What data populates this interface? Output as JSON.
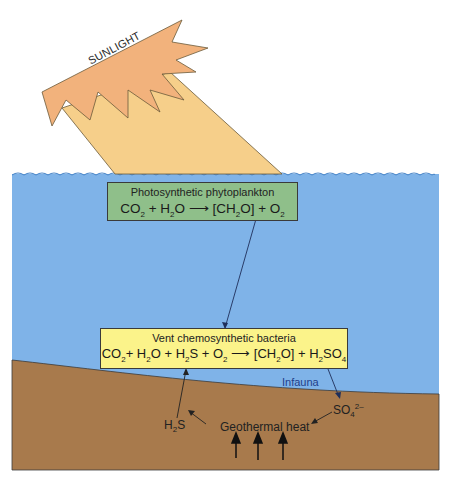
{
  "diagram": {
    "sun_label": "SUNLIGHT",
    "photosynthesis_box": {
      "title": "Photosynthetic phytoplankton",
      "equation": {
        "reactants": [
          "CO",
          "2",
          " + H",
          "2",
          "O"
        ],
        "arrow": "⟶",
        "products": [
          "[CH",
          "2",
          "O] + O",
          "2"
        ]
      },
      "color": "#8fbf8a"
    },
    "chemosynthesis_box": {
      "title": "Vent chemosynthetic bacteria",
      "equation": {
        "reactants": [
          "CO",
          "2",
          "+ H",
          "2",
          "O + H",
          "2",
          "S + O",
          "2"
        ],
        "arrow": "⟶",
        "products": [
          "[CH",
          "2",
          "O] + H",
          "2",
          "SO",
          "4"
        ]
      },
      "color": "#fbf38a"
    },
    "labels": {
      "infauna": "Infauna",
      "h2s": {
        "base": "H",
        "sub": "2",
        "tail": "S"
      },
      "so4": {
        "base": "SO",
        "sub": "4",
        "sup": "2–"
      },
      "geothermal": "Geothermal heat"
    },
    "colors": {
      "water": "#7fb3e8",
      "sediment": "#a87a4c",
      "sun": "#f2b27c",
      "beam": "#f6cf8a",
      "infauna_text": "#1f3f8a"
    }
  }
}
